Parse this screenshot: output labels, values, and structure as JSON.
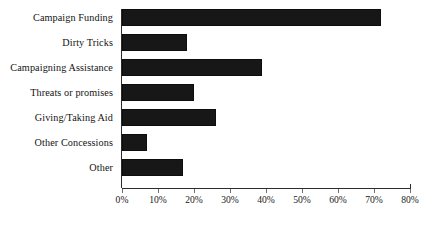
{
  "chart_data": {
    "type": "bar",
    "orientation": "horizontal",
    "title": "",
    "subtitle": "",
    "xlabel": "",
    "ylabel": "",
    "categories": [
      "Campaign Funding",
      "Dirty Tricks",
      "Campaigning Assistance",
      "Threats or promises",
      "Giving/Taking Aid",
      "Other Concessions",
      "Other"
    ],
    "values": [
      72,
      18,
      39,
      20,
      26,
      7,
      17
    ],
    "value_unit": "%",
    "xlim": [
      0,
      80
    ],
    "xticks": [
      0,
      10,
      20,
      30,
      40,
      50,
      60,
      70,
      80
    ],
    "xtick_labels": [
      "0%",
      "10%",
      "20%",
      "30%",
      "40%",
      "50%",
      "60%",
      "70%",
      "80%"
    ],
    "grid": false,
    "legend": null,
    "legend_position": "none",
    "bar_color": "#171717",
    "axis_color": "#2b2b2b",
    "background_color": "#ffffff",
    "annotations": []
  }
}
